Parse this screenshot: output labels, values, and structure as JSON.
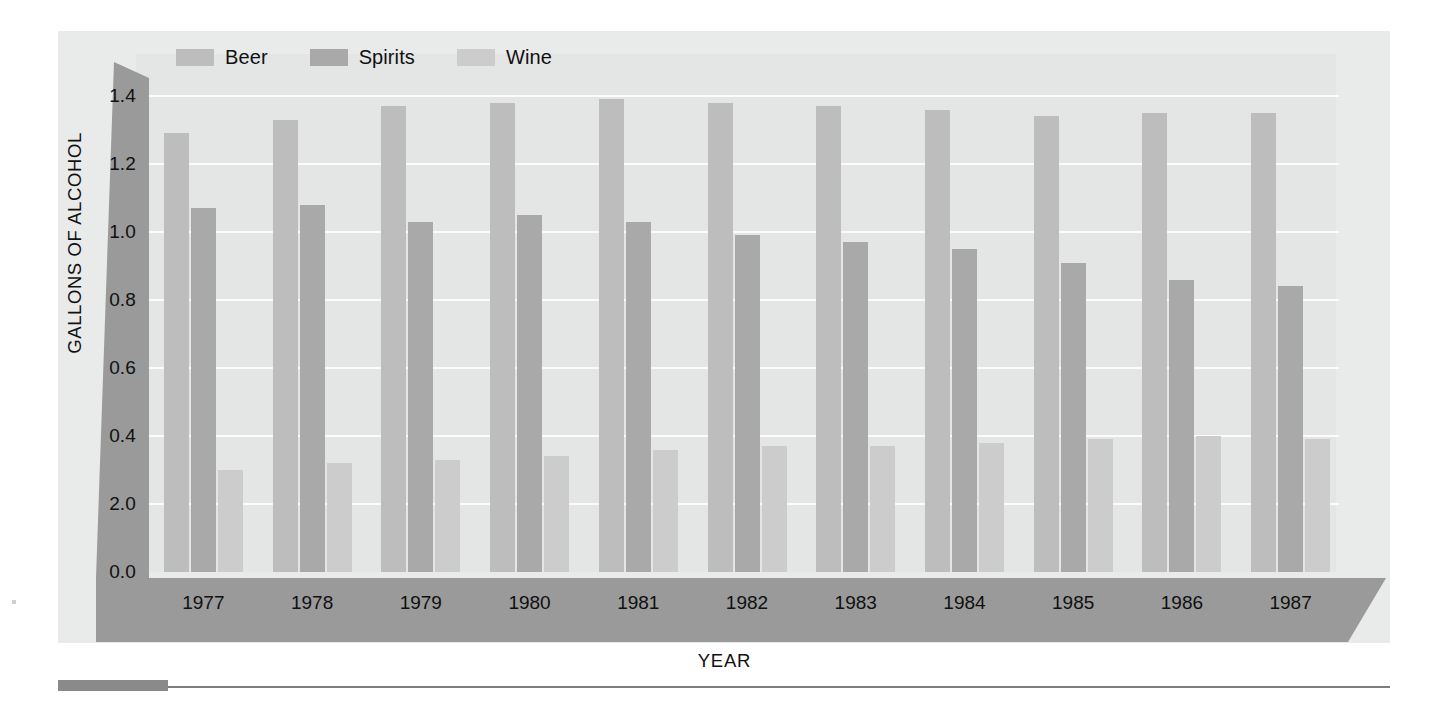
{
  "chart_data": {
    "type": "bar",
    "title": "",
    "xlabel": "YEAR",
    "ylabel": "GALLONS OF ALCOHOL",
    "categories": [
      "1977",
      "1978",
      "1979",
      "1980",
      "1981",
      "1982",
      "1983",
      "1984",
      "1985",
      "1986",
      "1987"
    ],
    "series": [
      {
        "name": "Beer",
        "values": [
          1.29,
          1.33,
          1.37,
          1.38,
          1.39,
          1.38,
          1.37,
          1.36,
          1.34,
          1.35,
          1.35
        ]
      },
      {
        "name": "Spirits",
        "values": [
          1.07,
          1.08,
          1.03,
          1.05,
          1.03,
          0.99,
          0.97,
          0.95,
          0.91,
          0.86,
          0.84
        ]
      },
      {
        "name": "Wine",
        "values": [
          0.3,
          0.32,
          0.33,
          0.34,
          0.36,
          0.37,
          0.37,
          0.38,
          0.39,
          0.4,
          0.39
        ]
      }
    ],
    "ytick_labels": [
      "1.4",
      "1.2",
      "1.0",
      "0.8",
      "0.6",
      "0.4",
      "2.0",
      "0.0"
    ],
    "ytick_values": [
      1.4,
      1.2,
      1.0,
      0.8,
      0.6,
      0.4,
      0.2,
      0.0
    ],
    "ylim": [
      0.0,
      1.4
    ],
    "grid": true,
    "legend_position": "top-left",
    "colors": {
      "beer": "#bdbdbd",
      "spirits": "#a9a9a9",
      "wine": "#cccccc",
      "axis_band": "#9a9a9a",
      "panel_bg": "#e9eaea",
      "plot_bg": "#e4e6e6",
      "gridline": "#fbfbfb",
      "text": "#101010"
    }
  },
  "legend": {
    "items": [
      {
        "label": "Beer",
        "key": "beer"
      },
      {
        "label": "Spirits",
        "key": "spirits"
      },
      {
        "label": "Wine",
        "key": "wine"
      }
    ]
  }
}
